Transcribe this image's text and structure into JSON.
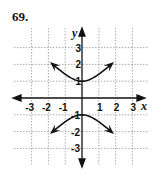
{
  "problem_number": "69.",
  "chart_data": {
    "type": "line",
    "title": "",
    "equation_hint": "hyperbola y^2 - x^2 = 1",
    "xlabel": "x",
    "ylabel": "y",
    "xlim": [
      -3.5,
      3.5
    ],
    "ylim": [
      -3.5,
      3.5
    ],
    "grid": true,
    "x_ticks": [
      -3,
      -2,
      -1,
      1,
      2,
      3
    ],
    "y_ticks": [
      3,
      2,
      1,
      -1,
      -2,
      -3
    ],
    "series": [
      {
        "name": "upper branch",
        "x": [
          -1.7,
          -1,
          0,
          1,
          1.7
        ],
        "y": [
          3.4,
          2.0,
          1,
          2.0,
          3.4
        ]
      },
      {
        "name": "lower branch",
        "x": [
          -1.7,
          -1,
          0,
          1,
          1.7
        ],
        "y": [
          -3.4,
          -2.0,
          -1,
          -2.0,
          -3.4
        ]
      }
    ]
  }
}
